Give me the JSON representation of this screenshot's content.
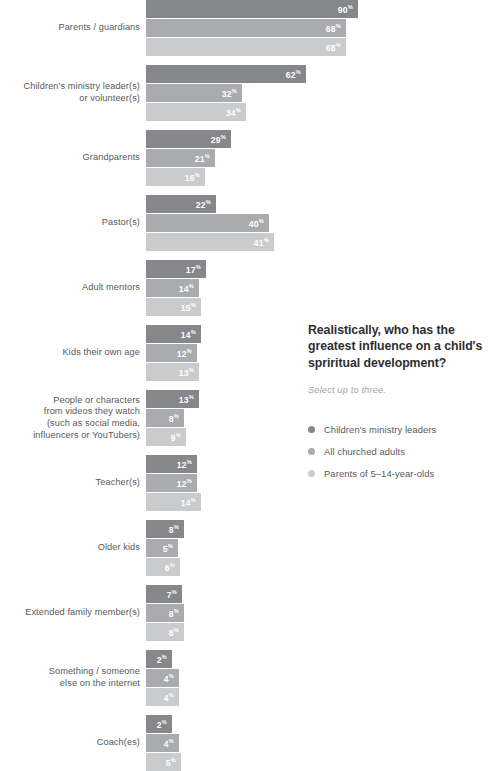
{
  "chart_data": {
    "type": "bar",
    "orientation": "horizontal",
    "title": "Realistically, who has the greatest influence on a child's spriritual development?",
    "subtitle": "Select up to three.",
    "xlabel": "",
    "ylabel": "",
    "value_suffix": "%",
    "grid": false,
    "legend_position": "right",
    "xlim": [
      0,
      90
    ],
    "series": [
      {
        "name": "Children's ministry leaders",
        "color": "#85878a",
        "values": [
          90,
          62,
          29,
          22,
          17,
          14,
          13,
          12,
          8,
          7,
          2,
          2
        ]
      },
      {
        "name": "All churched adults",
        "color": "#a9abae",
        "values": [
          68,
          32,
          21,
          40,
          14,
          12,
          8,
          12,
          5,
          8,
          4,
          4
        ]
      },
      {
        "name": "Parents of 5–14-year-olds",
        "color": "#c9cbcd",
        "values": [
          68,
          34,
          16,
          41,
          15,
          13,
          9,
          14,
          6,
          8,
          4,
          5
        ]
      }
    ],
    "categories": [
      "Parents / guardians",
      "Children's ministry leader(s) or volunteer(s)",
      "Grandparents",
      "Pastor(s)",
      "Adult mentors",
      "Kids their own age",
      "People or characters from videos they watch (such as social media, influencers or YouTubers)",
      "Teacher(s)",
      "Older kids",
      "Extended family member(s)",
      "Something / someone else on the internet",
      "Coach(es)"
    ],
    "category_lines": [
      [
        "Parents / guardians"
      ],
      [
        "Children's ministry leader(s)",
        "or volunteer(s)"
      ],
      [
        "Grandparents"
      ],
      [
        "Pastor(s)"
      ],
      [
        "Adult mentors"
      ],
      [
        "Kids their own age"
      ],
      [
        "People or characters",
        "from videos they watch",
        "(such as social media,",
        "influencers or YouTubers)"
      ],
      [
        "Teacher(s)"
      ],
      [
        "Older kids"
      ],
      [
        "Extended family member(s)"
      ],
      [
        "Something / someone",
        "else on the internet"
      ],
      [
        "Coach(es)"
      ]
    ],
    "bar_widths_px": [
      [
        212,
        160,
        85,
        70,
        60,
        55,
        53,
        51,
        38,
        36,
        26,
        26
      ],
      [
        200,
        96,
        69,
        123,
        53,
        51,
        38,
        51,
        32,
        38,
        33,
        33
      ],
      [
        200,
        100,
        59,
        128,
        55,
        53,
        40,
        55,
        34,
        38,
        33,
        35
      ]
    ]
  },
  "colors": {
    "series_1": "#85878a",
    "series_2": "#a9abae",
    "series_3": "#c9cbcd",
    "label_text": "#58585a",
    "title_text": "#2e2e30",
    "subtitle_text": "#a6a8ab",
    "value_text": "#ffffff",
    "background": "#ffffff"
  }
}
